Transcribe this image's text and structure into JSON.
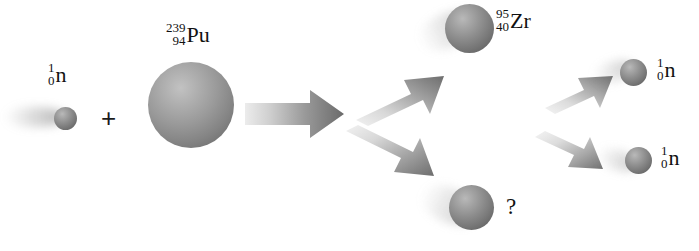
{
  "diagram": {
    "background_color": "#ffffff",
    "width": 699,
    "height": 251,
    "equation": "1/0 n + 239/94 Pu -> 95/40 Zr + ? + 2 ( 1/0 n )"
  },
  "reactants": {
    "neutron": {
      "mass_number": "1",
      "atomic_number": "0",
      "symbol": "n",
      "sphere_color": "#6f6f6f"
    },
    "plus": "+",
    "plutonium": {
      "mass_number": "239",
      "atomic_number": "94",
      "symbol": "Pu",
      "sphere_color": "#8a8a8a"
    }
  },
  "products": {
    "zirconium": {
      "mass_number": "95",
      "atomic_number": "40",
      "symbol": "Zr",
      "sphere_color": "#7d7d7d"
    },
    "unknown_fragment": {
      "label": "?",
      "sphere_color": "#6e6e6e"
    },
    "neutrons": [
      {
        "mass_number": "1",
        "atomic_number": "0",
        "symbol": "n",
        "sphere_color": "#6a6a6a"
      },
      {
        "mass_number": "1",
        "atomic_number": "0",
        "symbol": "n",
        "sphere_color": "#6a6a6a"
      }
    ]
  },
  "arrows": {
    "main": {
      "name": "fission-arrow",
      "direction": "right",
      "color_start": "#e2e2e2",
      "color_end": "#6c6c6c"
    },
    "branch_up": {
      "name": "product-arrow-up",
      "direction": "up-right",
      "color_start": "#ededed",
      "color_end": "#6e6e6e"
    },
    "branch_down": {
      "name": "product-arrow-down",
      "direction": "down-right",
      "color_start": "#ededed",
      "color_end": "#6e6e6e"
    },
    "neutron_up": {
      "name": "neutron-arrow-up",
      "direction": "up-right",
      "color_start": "#eeeeee",
      "color_end": "#707070"
    },
    "neutron_down": {
      "name": "neutron-arrow-down",
      "direction": "down-right",
      "color_start": "#eeeeee",
      "color_end": "#707070"
    }
  }
}
